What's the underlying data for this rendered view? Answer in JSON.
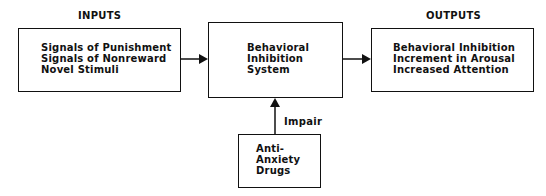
{
  "diagram": {
    "inputs_label": "INPUTS",
    "outputs_label": "OUTPUTS",
    "inputs_box": {
      "lines": [
        "Signals of Punishment",
        "Signals of Nonreward",
        "Novel Stimuli"
      ]
    },
    "center_box": {
      "lines": [
        "Behavioral",
        "Inhibition",
        "System"
      ]
    },
    "outputs_box": {
      "lines": [
        "Behavioral Inhibition",
        "Increment in Arousal",
        "Increased Attention"
      ]
    },
    "drug_box": {
      "lines": [
        "Anti-",
        "Anxiety",
        "Drugs"
      ]
    },
    "edge_label": "Impair",
    "edges": [
      {
        "from": "inputs_box",
        "to": "center_box"
      },
      {
        "from": "center_box",
        "to": "outputs_box"
      },
      {
        "from": "drug_box",
        "to": "center_box",
        "label": "Impair"
      }
    ],
    "colors": {
      "stroke": "#111111",
      "background": "#ffffff"
    }
  }
}
